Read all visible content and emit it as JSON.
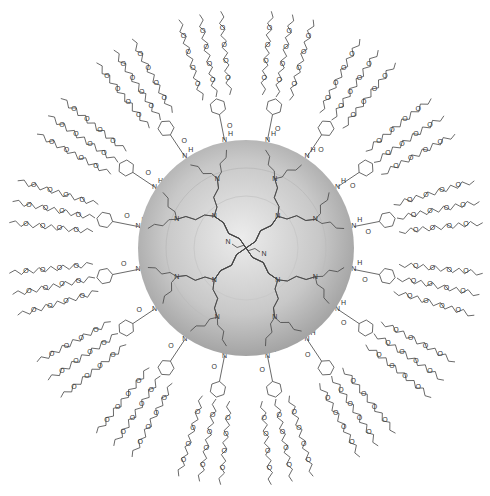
{
  "diagram": {
    "type": "dendrimer-structure",
    "core": {
      "label": "N",
      "linker": "butylene diamine core"
    },
    "sphere": {
      "cx": 246,
      "cy": 248,
      "r": 108,
      "color_center": "#e6e6e6",
      "color_edge": "#9a9a9a"
    },
    "generations": 3,
    "branch_atom_label": "N",
    "amide_labels": {
      "nitrogen": "N",
      "hydrogen": "H",
      "oxygen": "O"
    },
    "peripheral_groups": {
      "count": 16,
      "description": "3,4,5-tris(oligoethylene glycol) benzamide",
      "ether_oxygen_label": "O",
      "chains_per_group": 3
    },
    "line_color": "#444444"
  }
}
